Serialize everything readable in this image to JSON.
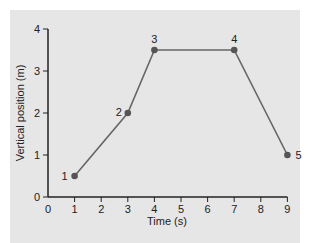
{
  "chart_data": {
    "type": "line",
    "title": "",
    "xlabel": "Time (s)",
    "ylabel": "Vertical position (m)",
    "xlim": [
      0,
      9
    ],
    "ylim": [
      0,
      4
    ],
    "xticks": [
      0,
      1,
      2,
      3,
      4,
      5,
      6,
      7,
      8,
      9
    ],
    "yticks": [
      0,
      1,
      2,
      3,
      4
    ],
    "grid": false,
    "series": [
      {
        "name": "position",
        "color": "#666666",
        "marker_color": "#555555",
        "points": [
          {
            "label": "1",
            "x": 1,
            "y": 0.5
          },
          {
            "label": "2",
            "x": 3,
            "y": 2
          },
          {
            "label": "3",
            "x": 4,
            "y": 3.5
          },
          {
            "label": "4",
            "x": 7,
            "y": 3.5
          },
          {
            "label": "5",
            "x": 9,
            "y": 1
          }
        ]
      }
    ]
  },
  "colors": {
    "panel_background": "#e6e6e6",
    "axis": "#222222",
    "line": "#666666"
  }
}
